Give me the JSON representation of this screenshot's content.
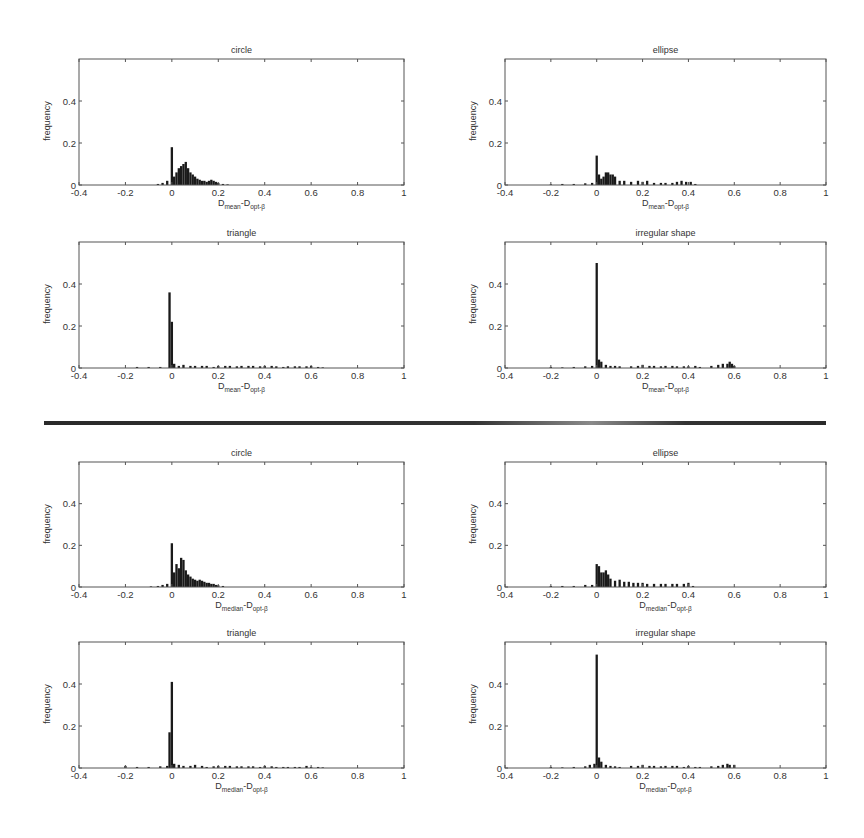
{
  "figure": {
    "divider_label": "",
    "colors": {
      "bar": "#1a1a1a",
      "axis": "#555555",
      "background": "#ffffff"
    }
  },
  "chart_data": [
    {
      "id": "mean-circle",
      "type": "bar",
      "title": "circle",
      "xlabel_main": "D",
      "xlabel_sub1": "mean",
      "xlabel_mid": "-D",
      "xlabel_sub2": "opt-β",
      "ylabel": "frequency",
      "xlim": [
        -0.4,
        1
      ],
      "ylim": [
        0,
        0.6
      ],
      "xticks": [
        "-0.4",
        "-0.2",
        "0",
        "0.2",
        "0.4",
        "0.6",
        "0.8",
        "1"
      ],
      "yticks": [
        "0",
        "0.2",
        "0.4"
      ],
      "x": [
        -0.06,
        -0.04,
        -0.02,
        0,
        0.01,
        0.02,
        0.03,
        0.04,
        0.05,
        0.06,
        0.07,
        0.08,
        0.09,
        0.1,
        0.11,
        0.12,
        0.13,
        0.14,
        0.15,
        0.16,
        0.17,
        0.18,
        0.19,
        0.2,
        0.22,
        0.24
      ],
      "values": [
        0.005,
        0.01,
        0.02,
        0.18,
        0.04,
        0.06,
        0.08,
        0.09,
        0.1,
        0.11,
        0.08,
        0.06,
        0.05,
        0.04,
        0.03,
        0.025,
        0.02,
        0.02,
        0.015,
        0.02,
        0.025,
        0.02,
        0.015,
        0.01,
        0.005,
        0.003
      ]
    },
    {
      "id": "mean-ellipse",
      "type": "bar",
      "title": "ellipse",
      "xlabel_main": "D",
      "xlabel_sub1": "mean",
      "xlabel_mid": "-D",
      "xlabel_sub2": "opt-β",
      "ylabel": "frequency",
      "xlim": [
        -0.4,
        1
      ],
      "ylim": [
        0,
        0.6
      ],
      "xticks": [
        "-0.4",
        "-0.2",
        "0",
        "0.2",
        "0.4",
        "0.6",
        "0.8",
        "1"
      ],
      "yticks": [
        "0",
        "0.2",
        "0.4"
      ],
      "x": [
        -0.2,
        -0.15,
        -0.1,
        -0.05,
        -0.02,
        0,
        0.01,
        0.02,
        0.03,
        0.04,
        0.05,
        0.06,
        0.07,
        0.08,
        0.1,
        0.12,
        0.15,
        0.18,
        0.2,
        0.22,
        0.25,
        0.28,
        0.3,
        0.33,
        0.35,
        0.37,
        0.39,
        0.41,
        0.43
      ],
      "values": [
        0.003,
        0.005,
        0.005,
        0.008,
        0.01,
        0.14,
        0.05,
        0.03,
        0.04,
        0.06,
        0.06,
        0.05,
        0.05,
        0.04,
        0.02,
        0.02,
        0.015,
        0.02,
        0.015,
        0.02,
        0.01,
        0.01,
        0.01,
        0.01,
        0.015,
        0.02,
        0.015,
        0.015,
        0.005
      ]
    },
    {
      "id": "mean-triangle",
      "type": "bar",
      "title": "triangle",
      "xlabel_main": "D",
      "xlabel_sub1": "mean",
      "xlabel_mid": "-D",
      "xlabel_sub2": "opt-β",
      "ylabel": "frequency",
      "xlim": [
        -0.4,
        1
      ],
      "ylim": [
        0,
        0.6
      ],
      "xticks": [
        "-0.4",
        "-0.2",
        "0",
        "0.2",
        "0.4",
        "0.6",
        "0.8",
        "1"
      ],
      "yticks": [
        "0",
        "0.2",
        "0.4"
      ],
      "x": [
        -0.15,
        -0.1,
        -0.05,
        -0.01,
        0,
        0.01,
        0.03,
        0.05,
        0.08,
        0.1,
        0.13,
        0.15,
        0.18,
        0.2,
        0.23,
        0.25,
        0.28,
        0.3,
        0.33,
        0.35,
        0.38,
        0.4,
        0.43,
        0.45,
        0.48,
        0.5,
        0.53,
        0.55,
        0.58,
        0.6,
        0.63,
        0.65
      ],
      "values": [
        0.005,
        0.005,
        0.005,
        0.36,
        0.22,
        0.02,
        0.01,
        0.015,
        0.01,
        0.01,
        0.01,
        0.01,
        0.005,
        0.01,
        0.01,
        0.01,
        0.008,
        0.01,
        0.01,
        0.01,
        0.008,
        0.01,
        0.01,
        0.008,
        0.005,
        0.008,
        0.008,
        0.008,
        0.008,
        0.01,
        0.005,
        0.003
      ]
    },
    {
      "id": "mean-irregular",
      "type": "bar",
      "title": "irregular shape",
      "xlabel_main": "D",
      "xlabel_sub1": "mean",
      "xlabel_mid": "-D",
      "xlabel_sub2": "opt-β",
      "ylabel": "frequency",
      "xlim": [
        -0.4,
        1
      ],
      "ylim": [
        0,
        0.6
      ],
      "xticks": [
        "-0.4",
        "-0.2",
        "0",
        "0.2",
        "0.4",
        "0.6",
        "0.8",
        "1"
      ],
      "yticks": [
        "0",
        "0.2",
        "0.4"
      ],
      "x": [
        -0.2,
        -0.15,
        -0.1,
        -0.05,
        -0.02,
        0,
        0.01,
        0.02,
        0.04,
        0.06,
        0.08,
        0.1,
        0.15,
        0.18,
        0.2,
        0.23,
        0.25,
        0.28,
        0.3,
        0.33,
        0.35,
        0.38,
        0.4,
        0.43,
        0.45,
        0.5,
        0.53,
        0.55,
        0.57,
        0.58,
        0.59,
        0.6
      ],
      "values": [
        0.005,
        0.003,
        0.005,
        0.008,
        0.01,
        0.5,
        0.04,
        0.03,
        0.015,
        0.01,
        0.01,
        0.008,
        0.008,
        0.01,
        0.015,
        0.01,
        0.01,
        0.008,
        0.01,
        0.01,
        0.008,
        0.008,
        0.008,
        0.01,
        0.005,
        0.01,
        0.015,
        0.02,
        0.02,
        0.03,
        0.02,
        0.01
      ]
    },
    {
      "id": "median-circle",
      "type": "bar",
      "title": "circle",
      "xlabel_main": "D",
      "xlabel_sub1": "median",
      "xlabel_mid": "-D",
      "xlabel_sub2": "opt-β",
      "ylabel": "frequency",
      "xlim": [
        -0.4,
        1
      ],
      "ylim": [
        0,
        0.6
      ],
      "xticks": [
        "-0.4",
        "-0.2",
        "0",
        "0.2",
        "0.4",
        "0.6",
        "0.8",
        "1"
      ],
      "yticks": [
        "0",
        "0.2",
        "0.4"
      ],
      "x": [
        -0.09,
        -0.06,
        -0.04,
        -0.02,
        0,
        0.01,
        0.02,
        0.03,
        0.04,
        0.05,
        0.06,
        0.07,
        0.08,
        0.09,
        0.1,
        0.11,
        0.12,
        0.13,
        0.14,
        0.15,
        0.16,
        0.17,
        0.18,
        0.19,
        0.2,
        0.22
      ],
      "values": [
        0.003,
        0.005,
        0.01,
        0.015,
        0.21,
        0.07,
        0.11,
        0.09,
        0.14,
        0.13,
        0.08,
        0.06,
        0.05,
        0.04,
        0.035,
        0.03,
        0.035,
        0.03,
        0.025,
        0.02,
        0.02,
        0.015,
        0.015,
        0.01,
        0.008,
        0.005
      ]
    },
    {
      "id": "median-ellipse",
      "type": "bar",
      "title": "ellipse",
      "xlabel_main": "D",
      "xlabel_sub1": "median",
      "xlabel_mid": "-D",
      "xlabel_sub2": "opt-β",
      "ylabel": "frequency",
      "xlim": [
        -0.4,
        1
      ],
      "ylim": [
        0,
        0.6
      ],
      "xticks": [
        "-0.4",
        "-0.2",
        "0",
        "0.2",
        "0.4",
        "0.6",
        "0.8",
        "1"
      ],
      "yticks": [
        "0",
        "0.2",
        "0.4"
      ],
      "x": [
        -0.2,
        -0.15,
        -0.1,
        -0.05,
        -0.02,
        0,
        0.01,
        0.02,
        0.03,
        0.04,
        0.05,
        0.06,
        0.08,
        0.1,
        0.12,
        0.14,
        0.16,
        0.18,
        0.2,
        0.22,
        0.25,
        0.28,
        0.3,
        0.33,
        0.35,
        0.38,
        0.4,
        0.42
      ],
      "values": [
        0.005,
        0.005,
        0.005,
        0.01,
        0.01,
        0.11,
        0.1,
        0.07,
        0.07,
        0.08,
        0.06,
        0.04,
        0.03,
        0.035,
        0.025,
        0.025,
        0.02,
        0.02,
        0.02,
        0.015,
        0.015,
        0.015,
        0.015,
        0.015,
        0.015,
        0.015,
        0.02,
        0.005
      ]
    },
    {
      "id": "median-triangle",
      "type": "bar",
      "title": "triangle",
      "xlabel_main": "D",
      "xlabel_sub1": "median",
      "xlabel_mid": "-D",
      "xlabel_sub2": "opt-β",
      "ylabel": "frequency",
      "xlim": [
        -0.4,
        1
      ],
      "ylim": [
        0,
        0.6
      ],
      "xticks": [
        "-0.4",
        "-0.2",
        "0",
        "0.2",
        "0.4",
        "0.6",
        "0.8",
        "1"
      ],
      "yticks": [
        "0",
        "0.2",
        "0.4"
      ],
      "x": [
        -0.2,
        -0.15,
        -0.1,
        -0.05,
        -0.02,
        -0.01,
        0,
        0.01,
        0.03,
        0.05,
        0.08,
        0.1,
        0.13,
        0.15,
        0.18,
        0.2,
        0.23,
        0.25,
        0.28,
        0.3,
        0.33,
        0.35,
        0.38,
        0.4,
        0.43,
        0.45,
        0.48,
        0.5,
        0.53,
        0.55,
        0.58,
        0.6,
        0.63,
        0.65
      ],
      "values": [
        0.01,
        0.005,
        0.005,
        0.008,
        0.01,
        0.17,
        0.41,
        0.02,
        0.015,
        0.01,
        0.01,
        0.015,
        0.01,
        0.005,
        0.008,
        0.01,
        0.01,
        0.01,
        0.008,
        0.008,
        0.008,
        0.008,
        0.005,
        0.01,
        0.008,
        0.005,
        0.005,
        0.005,
        0.005,
        0.005,
        0.01,
        0.005,
        0.005,
        0.003
      ]
    },
    {
      "id": "median-irregular",
      "type": "bar",
      "title": "irregular shape",
      "xlabel_main": "D",
      "xlabel_sub1": "median",
      "xlabel_mid": "-D",
      "xlabel_sub2": "opt-β",
      "ylabel": "frequency",
      "xlim": [
        -0.4,
        1
      ],
      "ylim": [
        0,
        0.6
      ],
      "xticks": [
        "-0.4",
        "-0.2",
        "0",
        "0.2",
        "0.4",
        "0.6",
        "0.8",
        "1"
      ],
      "yticks": [
        "0",
        "0.2",
        "0.4"
      ],
      "x": [
        -0.2,
        -0.15,
        -0.1,
        -0.05,
        -0.03,
        -0.01,
        0,
        0.01,
        0.02,
        0.04,
        0.06,
        0.08,
        0.1,
        0.15,
        0.18,
        0.2,
        0.23,
        0.25,
        0.28,
        0.3,
        0.33,
        0.35,
        0.38,
        0.4,
        0.43,
        0.45,
        0.5,
        0.53,
        0.55,
        0.57,
        0.58,
        0.6
      ],
      "values": [
        0.005,
        0.003,
        0.005,
        0.008,
        0.015,
        0.02,
        0.54,
        0.05,
        0.03,
        0.015,
        0.01,
        0.008,
        0.005,
        0.01,
        0.01,
        0.015,
        0.01,
        0.01,
        0.008,
        0.01,
        0.01,
        0.01,
        0.005,
        0.01,
        0.005,
        0.005,
        0.008,
        0.01,
        0.015,
        0.02,
        0.015,
        0.015
      ]
    }
  ]
}
